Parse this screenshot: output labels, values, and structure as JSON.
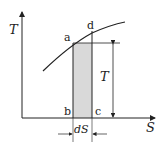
{
  "diagram": {
    "type": "T-S diagram",
    "axes": {
      "y_label": "T",
      "x_label": "S"
    },
    "points": {
      "a": "a",
      "b": "b",
      "c": "c",
      "d": "d"
    },
    "dimensions": {
      "height_label": "T",
      "width_label": "dS"
    },
    "colors": {
      "line": "#222222",
      "shade": "#d9d9d9"
    }
  }
}
